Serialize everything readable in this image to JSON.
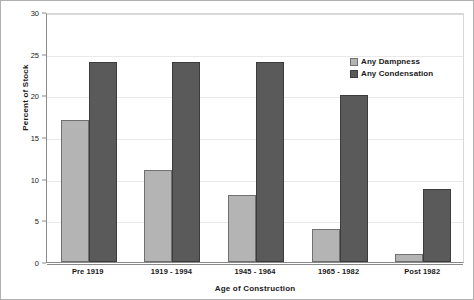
{
  "chart_data": {
    "type": "bar",
    "title": "",
    "xlabel": "Age of Construction",
    "ylabel": "Percent of Stock",
    "categories": [
      "Pre 1919",
      "1919 - 1994",
      "1945 - 1964",
      "1965 - 1982",
      "Post 1982"
    ],
    "series": [
      {
        "name": "Any Dampness",
        "color": "#b4b4b4",
        "values": [
          17,
          11,
          8,
          4,
          1
        ]
      },
      {
        "name": "Any Condensation",
        "color": "#5a5a5a",
        "values": [
          24,
          24,
          24,
          20,
          8.8
        ]
      }
    ],
    "ylim": [
      0,
      30
    ],
    "yticks": [
      0,
      5,
      10,
      15,
      20,
      25,
      30
    ],
    "ytick_labels": [
      "0",
      "5",
      "10",
      "15",
      "20",
      "25",
      "30"
    ],
    "grid": true,
    "legend_position": "top-right-inside"
  }
}
